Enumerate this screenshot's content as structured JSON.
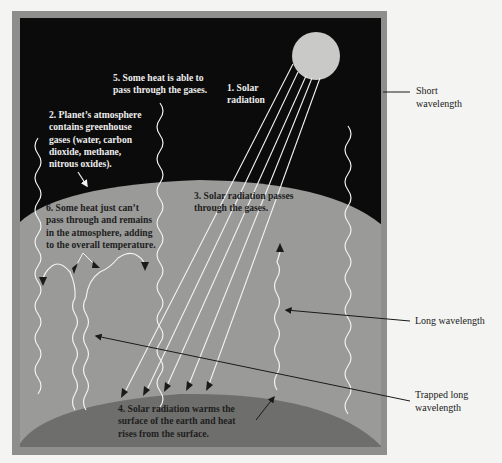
{
  "diagram": {
    "colors": {
      "page_background": "#f4f4f2",
      "frame": "#8e8e8c",
      "space": "#0b0b0b",
      "atmosphere": "#9a9a98",
      "earth_surface": "#6e6e6c",
      "sun": "#c9c9c7",
      "ray": "#f2f2f2",
      "pointer_line": "#1a1a1a"
    },
    "steps": [
      {
        "number": "1",
        "text": "1. Solar\nradiation"
      },
      {
        "number": "2",
        "text": "2. Planet’s atmosphere\ncontains greenhouse\ngases (water, carbon\ndioxide, methane,\nnitrous oxides)."
      },
      {
        "number": "3",
        "text": "3. Solar radiation passes\nthrough the gases."
      },
      {
        "number": "4",
        "text": "4. Solar radiation warms the\nsurface of the earth and heat\nrises from the surface."
      },
      {
        "number": "5",
        "text": "5. Some heat is able to\npass through the gases."
      },
      {
        "number": "6",
        "text": "6. Some heat just can’t\npass through and remains\nin the atmosphere, adding\nto the overall temperature."
      }
    ],
    "side_labels": {
      "short_wavelength": "Short\nwavelength",
      "long_wavelength": "Long wavelength",
      "trapped_long_wavelength": "Trapped long\nwavelength"
    },
    "elements": {
      "sun": "sun-icon",
      "solar_rays_count": 5,
      "escaping_heat_waves_count": 3,
      "trapped_heat_waves_count": 4
    }
  }
}
